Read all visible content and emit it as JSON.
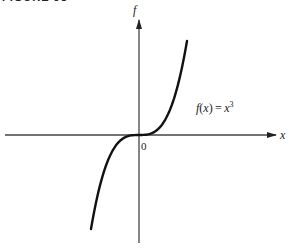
{
  "caption": "FIGURE 38",
  "diagram": {
    "type": "function-plot",
    "y_axis_label": "f",
    "x_axis_label": "x",
    "origin_label": "0",
    "curve_label": "f(x) = x³",
    "function": "x^3",
    "colors": {
      "axis": "#333333",
      "curve": "#111111"
    }
  }
}
